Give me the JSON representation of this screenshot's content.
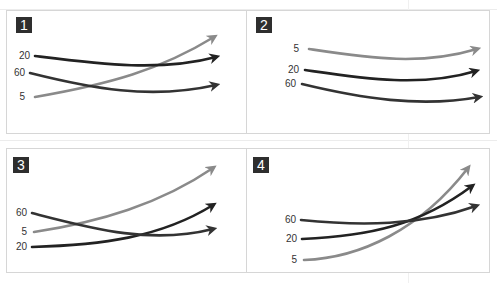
{
  "figure": {
    "panels": [
      {
        "number": "1",
        "labels": [
          {
            "text": "20",
            "x": 6,
            "y": 51
          },
          {
            "text": "60",
            "x": 1,
            "y": 68
          },
          {
            "text": "5",
            "x": 1,
            "y": 92
          }
        ],
        "curves": [
          {
            "name": "5",
            "color": "#8a8a8a",
            "d": "M35,97 C110,84 160,70 214,37"
          },
          {
            "name": "20",
            "color": "#222222",
            "d": "M35,56 C100,64 160,72 216,57"
          },
          {
            "name": "60",
            "color": "#333333",
            "d": "M30,73 C90,88 150,100 216,85"
          }
        ]
      },
      {
        "number": "2",
        "labels": [
          {
            "text": "5",
            "x": 275,
            "y": 44
          },
          {
            "text": "20",
            "x": 275,
            "y": 65
          },
          {
            "text": "60",
            "x": 272,
            "y": 79
          }
        ],
        "curves": [
          {
            "name": "5",
            "color": "#8a8a8a",
            "d": "M309,49 C370,58 420,66 477,49"
          },
          {
            "name": "20",
            "color": "#222222",
            "d": "M305,70 C360,78 420,88 476,71"
          },
          {
            "name": "60",
            "color": "#333333",
            "d": "M302,84 C360,98 420,108 479,97"
          }
        ]
      },
      {
        "number": "3",
        "labels": [
          {
            "text": "60",
            "x": 3,
            "y": 208
          },
          {
            "text": "5",
            "x": 3,
            "y": 227
          },
          {
            "text": "20",
            "x": 3,
            "y": 242
          }
        ],
        "curves": [
          {
            "name": "5",
            "color": "#8a8a8a",
            "d": "M34,232 C100,222 160,204 213,168"
          },
          {
            "name": "20",
            "color": "#222222",
            "d": "M32,247 C100,245 160,238 213,205"
          },
          {
            "name": "60",
            "color": "#333333",
            "d": "M32,213 C90,228 150,245 213,229"
          }
        ]
      },
      {
        "number": "4",
        "labels": [
          {
            "text": "60",
            "x": 272,
            "y": 215
          },
          {
            "text": "20",
            "x": 273,
            "y": 234
          },
          {
            "text": "5",
            "x": 273,
            "y": 255
          }
        ],
        "curves": [
          {
            "name": "5",
            "color": "#8a8a8a",
            "d": "M304,260 C360,258 420,230 468,168"
          },
          {
            "name": "20",
            "color": "#222222",
            "d": "M302,239 C370,236 420,225 472,186"
          },
          {
            "name": "60",
            "color": "#333333",
            "d": "M301,220 C360,226 420,226 476,206"
          }
        ]
      }
    ]
  }
}
